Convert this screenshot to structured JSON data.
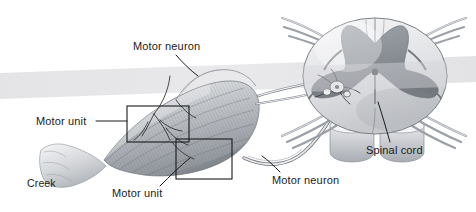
{
  "figure": {
    "background_color": "#ffffff",
    "band_color": "#e6e6e8",
    "ink_color": "#1b1b1b",
    "muscle_tone": "#b9bcc0",
    "gray_matter_color": "#8d9197",
    "white_matter_color": "#e2e3e6"
  },
  "labels": {
    "motor_neuron_top": "Motor neuron",
    "motor_unit_upper": "Motor unit",
    "motor_unit_lower": "Motor unit",
    "creek": "Creek",
    "motor_neuron_bottom": "Motor neuron",
    "spinal_cord": "Spinal cord"
  },
  "structures": {
    "muscle_belly": "skeletal-muscle-belly",
    "tendon": "tendon",
    "motor_unit_box_upper": "motor-unit-callout-box",
    "motor_unit_box_lower": "motor-unit-callout-box",
    "nerve_branches": "intramuscular-nerve-branches",
    "peripheral_nerve": "peripheral-motor-nerve",
    "spinal_cord_section": "spinal-cord-cross-section",
    "gray_matter": "butterfly-gray-matter",
    "ventral_horn_neuron": "ventral-horn-motor-neuron-cell-body",
    "central_canal": "central-canal",
    "dorsal_roots": "dorsal-nerve-roots",
    "ventral_roots": "ventral-nerve-roots",
    "vertebral_bodies": "vertebral-body-segments"
  }
}
